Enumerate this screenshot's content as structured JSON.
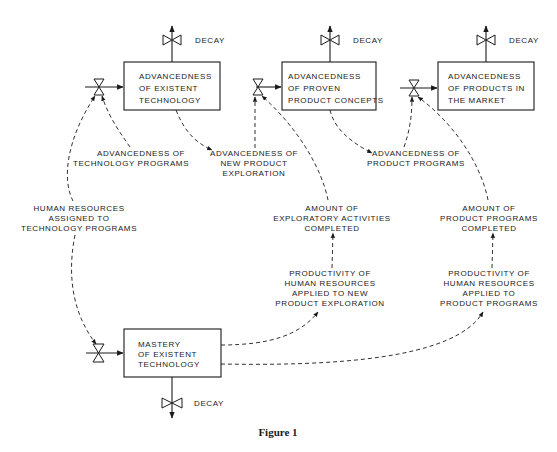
{
  "diagram": {
    "type": "stock-and-flow",
    "caption": "Figure 1",
    "stocks": [
      {
        "id": "existent_tech",
        "lines": [
          "ADVANCEDNESS",
          "OF EXISTENT",
          "TECHNOLOGY"
        ]
      },
      {
        "id": "proven_concepts",
        "lines": [
          "ADVANCEDNESS",
          "OF PROVEN",
          "PRODUCT CONCEPTS"
        ]
      },
      {
        "id": "products_market",
        "lines": [
          "ADVANCEDNESS",
          "OF PRODUCTS IN",
          "THE MARKET"
        ]
      },
      {
        "id": "mastery",
        "lines": [
          "MASTERY",
          "OF EXISTENT",
          "TECHNOLOGY"
        ]
      }
    ],
    "decay_label": "DECAY",
    "auxiliaries": [
      {
        "id": "adv_tech_programs",
        "lines": [
          "ADVANCEDNESS OF",
          "TECHNOLOGY PROGRAMS"
        ]
      },
      {
        "id": "adv_new_product_expl",
        "lines": [
          "ADVANCEDNESS OF",
          "NEW PRODUCT",
          "EXPLORATION"
        ]
      },
      {
        "id": "adv_product_programs",
        "lines": [
          "ADVANCEDNESS OF",
          "PRODUCT PROGRAMS"
        ]
      },
      {
        "id": "human_resources",
        "lines": [
          "HUMAN RESOURCES",
          "ASSIGNED TO",
          "TECHNOLOGY PROGRAMS"
        ]
      },
      {
        "id": "amount_exploratory",
        "lines": [
          "AMOUNT OF",
          "EXPLORATORY ACTIVITIES",
          "COMPLETED"
        ]
      },
      {
        "id": "amount_product_programs",
        "lines": [
          "AMOUNT OF",
          "PRODUCT PROGRAMS",
          "COMPLETED"
        ]
      },
      {
        "id": "productivity_expl",
        "lines": [
          "PRODUCTIVITY OF",
          "HUMAN RESOURCES",
          "APPLIED TO NEW",
          "PRODUCT EXPLORATION"
        ]
      },
      {
        "id": "productivity_programs",
        "lines": [
          "PRODUCTIVITY OF",
          "HUMAN RESOURCES",
          "APPLIED TO",
          "PRODUCT PROGRAMS"
        ]
      }
    ],
    "links": [
      {
        "from": "human_resources",
        "to": "existent_tech_inflow_valve"
      },
      {
        "from": "adv_tech_programs",
        "to": "existent_tech_inflow_valve"
      },
      {
        "from": "existent_tech",
        "to": "adv_new_product_expl"
      },
      {
        "from": "adv_new_product_expl",
        "to": "proven_concepts_inflow_valve"
      },
      {
        "from": "amount_exploratory",
        "to": "proven_concepts_inflow_valve"
      },
      {
        "from": "proven_concepts",
        "to": "adv_product_programs"
      },
      {
        "from": "adv_product_programs",
        "to": "products_market_inflow_valve"
      },
      {
        "from": "amount_product_programs",
        "to": "products_market_inflow_valve"
      },
      {
        "from": "human_resources",
        "to": "mastery_inflow_valve"
      },
      {
        "from": "mastery",
        "to": "productivity_expl"
      },
      {
        "from": "mastery",
        "to": "productivity_programs"
      },
      {
        "from": "productivity_expl",
        "to": "amount_exploratory"
      },
      {
        "from": "productivity_programs",
        "to": "amount_product_programs"
      }
    ]
  }
}
